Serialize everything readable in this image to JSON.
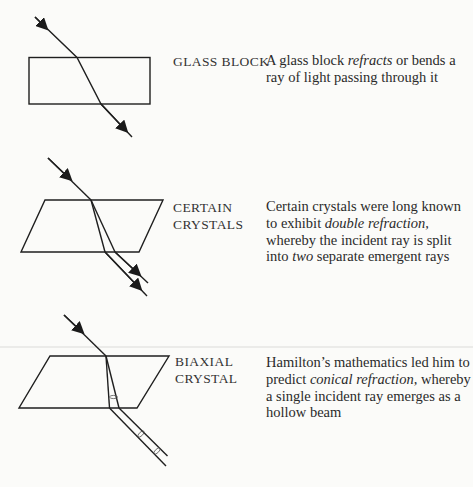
{
  "sections": [
    {
      "label_lines": [
        "GLASS BLOCK"
      ],
      "description": {
        "parts": [
          {
            "text": "A glass block ",
            "italic": false
          },
          {
            "text": "refracts",
            "italic": true
          },
          {
            "text": " or bends a ray of light passing through it",
            "italic": false
          }
        ]
      }
    },
    {
      "label_lines": [
        "CERTAIN",
        "CRYSTALS"
      ],
      "description": {
        "parts": [
          {
            "text": "Certain crystals were long known to exhibit ",
            "italic": false
          },
          {
            "text": "double refraction,",
            "italic": true
          },
          {
            "text": " whereby the incident ray is split into ",
            "italic": false
          },
          {
            "text": "two",
            "italic": true
          },
          {
            "text": " separate emergent rays",
            "italic": false
          }
        ]
      }
    },
    {
      "label_lines": [
        "BIAXIAL",
        "CRYSTAL"
      ],
      "description": {
        "parts": [
          {
            "text": "Hamilton’s mathematics led him to predict ",
            "italic": false
          },
          {
            "text": "conical refraction,",
            "italic": true
          },
          {
            "text": " whereby a single incident ray emerges as a hollow beam",
            "italic": false
          }
        ]
      }
    }
  ],
  "colors": {
    "ink": "#2a2a2a",
    "paper": "#fbfbf9",
    "artifact_line": "#d8d8d6"
  }
}
